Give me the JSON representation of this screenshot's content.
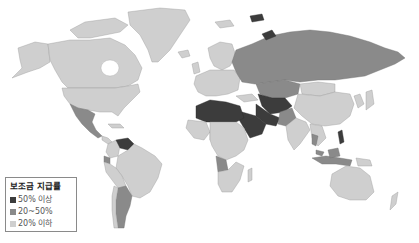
{
  "map": {
    "title": "보조금 지급률",
    "type": "choropleth world map",
    "colors": {
      "high": "#3c3c3c",
      "mid": "#8a8a8a",
      "low": "#cfcfcf",
      "background": "#ffffff"
    },
    "legend": {
      "title": "보조금 지급률",
      "items": [
        {
          "label": "50% 이상",
          "color": "#3c3c3c"
        },
        {
          "label": "20~50%",
          "color": "#8a8a8a"
        },
        {
          "label": "20% 이하",
          "color": "#cfcfcf"
        }
      ]
    },
    "regions": {
      "high": [
        "Venezuela",
        "North Africa (Algeria, Libya, Egypt)",
        "Saudi Arabia",
        "Iran",
        "Iraq",
        "Turkmenistan",
        "Uzbekistan",
        "Svalbard/Arctic islands"
      ],
      "mid": [
        "Russia",
        "Kazakhstan",
        "Argentina",
        "Ecuador",
        "Angola",
        "Nigeria",
        "Pakistan",
        "Indonesia",
        "Malaysia",
        "Mexico (partial)"
      ],
      "low": [
        "Canada",
        "United States",
        "Greenland",
        "Brazil",
        "Europe",
        "China",
        "India",
        "Australia",
        "most of Africa"
      ]
    }
  }
}
